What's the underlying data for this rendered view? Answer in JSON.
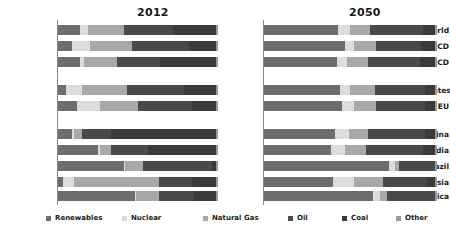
{
  "panels": [
    {
      "label": "2012"
    },
    {
      "label": "2050"
    }
  ],
  "row_labels": [
    "World",
    "OECD",
    "Non-OECD",
    "United States",
    "EU",
    "China",
    "India",
    "Brazil",
    "Russia",
    "Africa"
  ],
  "legend": {
    "items": [
      {
        "label": "Renewables",
        "color": "#6d6d6d"
      },
      {
        "label": "Nuclear",
        "color": "#dcdcdc"
      },
      {
        "label": "Natural Gas",
        "color": "#a8a8a8"
      },
      {
        "label": "Oil",
        "color": "#4a4a4a"
      },
      {
        "label": "Coal",
        "color": "#3a3a3a"
      },
      {
        "label": "Other",
        "color": "#9a9a9a"
      }
    ]
  },
  "chart_data": {
    "type": "bar",
    "subtype": "stacked-horizontal-100pct",
    "title": "",
    "panel_titles": [
      "2012",
      "2050"
    ],
    "xlabel": "",
    "ylabel": "",
    "xlim": [
      0,
      100
    ],
    "grid": false,
    "legend_position": "bottom",
    "categories": [
      "World",
      "OECD",
      "Non-OECD",
      "United States",
      "EU",
      "China",
      "India",
      "Brazil",
      "Russia",
      "Africa"
    ],
    "category_groups": [
      [
        "World",
        "OECD",
        "Non-OECD"
      ],
      [
        "United States",
        "EU"
      ],
      [
        "China",
        "India",
        "Brazil",
        "Russia",
        "Africa"
      ]
    ],
    "series_names": [
      "Renewables",
      "Nuclear",
      "Natural Gas",
      "Oil",
      "Coal",
      "Other"
    ],
    "series_colors": [
      "#6d6d6d",
      "#dcdcdc",
      "#a8a8a8",
      "#4a4a4a",
      "#3a3a3a",
      "#9a9a9a"
    ],
    "panels": [
      {
        "name": "2012",
        "rows": [
          {
            "category": "World",
            "values": [
              14,
              5,
              22,
              31,
              27,
              1
            ]
          },
          {
            "category": "OECD",
            "values": [
              9,
              11,
              26,
              36,
              17,
              1
            ]
          },
          {
            "category": "Non-OECD",
            "values": [
              14,
              2,
              21,
              27,
              35,
              1
            ]
          },
          {
            "category": "United States",
            "values": [
              5,
              10,
              28,
              36,
              20,
              1
            ]
          },
          {
            "category": "EU",
            "values": [
              12,
              14,
              24,
              34,
              15,
              1
            ]
          },
          {
            "category": "China",
            "values": [
              9,
              1,
              5,
              18,
              66,
              1
            ]
          },
          {
            "category": "India",
            "values": [
              25,
              1,
              7,
              23,
              43,
              1
            ]
          },
          {
            "category": "Brazil",
            "values": [
              41,
              1,
              11,
              43,
              3,
              1
            ]
          },
          {
            "category": "Russia",
            "values": [
              3,
              7,
              53,
              21,
              15,
              1
            ]
          },
          {
            "category": "Africa",
            "values": [
              48,
              1,
              14,
              22,
              14,
              1
            ]
          }
        ]
      },
      {
        "name": "2050",
        "rows": [
          {
            "category": "World",
            "values": [
              43,
              7,
              11,
              31,
              7,
              1
            ]
          },
          {
            "category": "OECD",
            "values": [
              47,
              5,
              13,
              26,
              8,
              1
            ]
          },
          {
            "category": "Non-OECD",
            "values": [
              42,
              6,
              12,
              30,
              9,
              1
            ]
          },
          {
            "category": "United States",
            "values": [
              44,
              6,
              14,
              29,
              6,
              1
            ]
          },
          {
            "category": "EU",
            "values": [
              45,
              7,
              13,
              28,
              6,
              1
            ]
          },
          {
            "category": "China",
            "values": [
              41,
              8,
              11,
              33,
              6,
              1
            ]
          },
          {
            "category": "India",
            "values": [
              39,
              8,
              12,
              33,
              7,
              1
            ]
          },
          {
            "category": "Brazil",
            "values": [
              72,
              4,
              2,
              21,
              0,
              1
            ]
          },
          {
            "category": "Russia",
            "values": [
              40,
              12,
              17,
              25,
              5,
              1
            ]
          },
          {
            "category": "Africa",
            "values": [
              63,
              4,
              4,
              28,
              0,
              1
            ]
          }
        ]
      }
    ]
  }
}
